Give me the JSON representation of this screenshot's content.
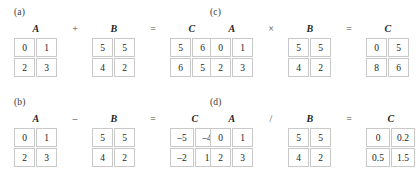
{
  "figure": {
    "type": "matrix-operations-diagram",
    "panels": [
      {
        "tag": "(a)",
        "operation": "addition",
        "operator": "+",
        "equals": "=",
        "terms": [
          {
            "label": "A",
            "rows": [
              [
                "0",
                "1"
              ],
              [
                "2",
                "3"
              ]
            ]
          },
          {
            "label": "B",
            "rows": [
              [
                "5",
                "5"
              ],
              [
                "4",
                "2"
              ]
            ]
          },
          {
            "label": "C",
            "rows": [
              [
                "5",
                "6"
              ],
              [
                "6",
                "5"
              ]
            ]
          }
        ]
      },
      {
        "tag": "(b)",
        "operation": "subtraction",
        "operator": "–",
        "equals": "=",
        "terms": [
          {
            "label": "A",
            "rows": [
              [
                "0",
                "1"
              ],
              [
                "2",
                "3"
              ]
            ]
          },
          {
            "label": "B",
            "rows": [
              [
                "5",
                "5"
              ],
              [
                "4",
                "2"
              ]
            ]
          },
          {
            "label": "C",
            "rows": [
              [
                "–5",
                "–4"
              ],
              [
                "–2",
                "1"
              ]
            ]
          }
        ]
      },
      {
        "tag": "(c)",
        "operation": "multiplication",
        "operator": "×",
        "equals": "=",
        "terms": [
          {
            "label": "A",
            "rows": [
              [
                "0",
                "1"
              ],
              [
                "2",
                "3"
              ]
            ]
          },
          {
            "label": "B",
            "rows": [
              [
                "5",
                "5"
              ],
              [
                "4",
                "2"
              ]
            ]
          },
          {
            "label": "C",
            "rows": [
              [
                "0",
                "5"
              ],
              [
                "8",
                "6"
              ]
            ]
          }
        ]
      },
      {
        "tag": "(d)",
        "operation": "division",
        "operator": "/",
        "equals": "=",
        "terms": [
          {
            "label": "A",
            "rows": [
              [
                "0",
                "1"
              ],
              [
                "2",
                "3"
              ]
            ]
          },
          {
            "label": "B",
            "rows": [
              [
                "5",
                "5"
              ],
              [
                "4",
                "2"
              ]
            ]
          },
          {
            "label": "C",
            "rows": [
              [
                "0",
                "0.2"
              ],
              [
                "0.5",
                "1.5"
              ]
            ]
          }
        ]
      }
    ]
  },
  "colors": {
    "background": "#ffffff",
    "cell_border": "#c9c9c9",
    "text": "#232323",
    "operator": "#4a4a4a"
  }
}
